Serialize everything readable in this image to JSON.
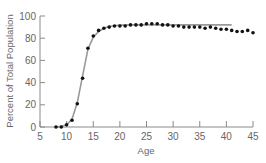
{
  "chart_data": {
    "type": "scatter",
    "title": "",
    "xlabel": "Age",
    "ylabel": "Percent of Total Population",
    "xlim": [
      5,
      45
    ],
    "ylim": [
      0,
      100
    ],
    "xticks": [
      5,
      10,
      15,
      20,
      25,
      30,
      35,
      40,
      45
    ],
    "yticks": [
      0,
      20,
      40,
      60,
      80,
      100
    ],
    "grid": false,
    "legend": null,
    "series": [
      {
        "name": "observed",
        "style": "points",
        "color": "#111111",
        "x": [
          8,
          9,
          10,
          11,
          12,
          13,
          14,
          15,
          16,
          17,
          18,
          19,
          20,
          21,
          22,
          23,
          24,
          25,
          26,
          27,
          28,
          29,
          30,
          31,
          32,
          33,
          34,
          35,
          36,
          37,
          38,
          39,
          40,
          41,
          42,
          43,
          44,
          45
        ],
        "y": [
          0,
          0,
          2,
          6,
          21,
          44,
          71,
          82,
          87,
          89,
          90,
          91,
          91,
          91,
          92,
          92,
          92,
          93,
          93,
          93,
          92,
          92,
          91,
          91,
          90,
          90,
          90,
          90,
          89,
          90,
          89,
          88,
          88,
          87,
          86,
          86,
          87,
          85
        ]
      },
      {
        "name": "fitted curve",
        "style": "line",
        "color": "#999999",
        "x": [
          8,
          9,
          10,
          11,
          12,
          13,
          14,
          15,
          16,
          17,
          18,
          19,
          20,
          22,
          25,
          30,
          35,
          41
        ],
        "y": [
          0,
          0.5,
          2,
          7,
          22,
          46,
          70,
          81,
          86,
          89,
          90.5,
          91.3,
          91.8,
          92,
          92,
          92,
          92,
          92
        ]
      }
    ]
  }
}
